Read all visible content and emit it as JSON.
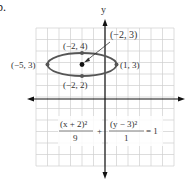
{
  "problem_number": "b.",
  "chart_data": {
    "type": "line",
    "title": "",
    "xlabel": "",
    "ylabel": "y",
    "xlim": [
      -6,
      6
    ],
    "ylim": [
      -6,
      6
    ],
    "grid": true,
    "equation": {
      "num1": "(x + 2)²",
      "den1": "9",
      "plus": "+",
      "num2": "(y − 3)²",
      "den2": "1",
      "rhs": "= 1"
    },
    "ellipse": {
      "center": [
        -2,
        3
      ],
      "a": 3,
      "b": 1
    },
    "points": [
      {
        "label": "(−5, 3)",
        "x": -5,
        "y": 3
      },
      {
        "label": "(1, 3)",
        "x": 1,
        "y": 3
      },
      {
        "label": "(−2, 4)",
        "x": -2,
        "y": 4
      },
      {
        "label": "(−2, 2)",
        "x": -2,
        "y": 2
      },
      {
        "label": "(−2, 3)",
        "x": -2,
        "y": 3,
        "is_center": true
      }
    ],
    "colors": {
      "ellipse": "#555555",
      "grid": "#cccccc",
      "axis": "#111111"
    }
  }
}
